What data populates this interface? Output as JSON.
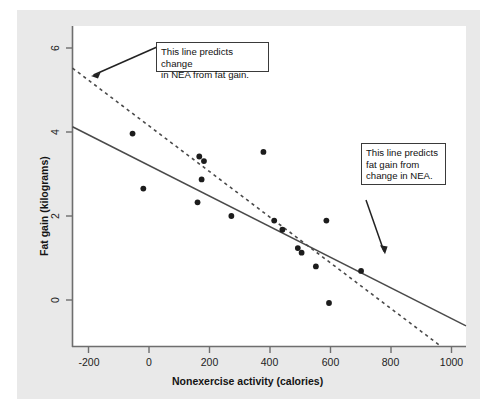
{
  "figure": {
    "background_color": "#e9e9e9",
    "plot_background_color": "#ffffff",
    "axis_color": "#6e6e6e",
    "point_color": "#1c1c1c",
    "line_color": "#4a4a4a"
  },
  "chart_data": {
    "type": "scatter",
    "title": "",
    "xlabel": "Nonexercise activity (calories)",
    "ylabel": "Fat gain (kilograms)",
    "xlim": [
      -300,
      1050
    ],
    "ylim": [
      -0.45,
      6.55
    ],
    "xticks": [
      -200,
      0,
      200,
      400,
      600,
      800,
      1000
    ],
    "xtick_labels": [
      "-200",
      "0",
      "200",
      "400",
      "600",
      "800",
      "1000"
    ],
    "yticks": [
      0,
      2,
      4,
      6
    ],
    "ytick_labels": [
      "0",
      "2",
      "4",
      "6"
    ],
    "grid": false,
    "legend": "none",
    "points": [
      {
        "x": -94,
        "y": 4.2
      },
      {
        "x": -57,
        "y": 3.0
      },
      {
        "x": 135,
        "y": 3.7
      },
      {
        "x": 143,
        "y": 3.2
      },
      {
        "x": 151,
        "y": 3.6
      },
      {
        "x": 129,
        "y": 2.7
      },
      {
        "x": 245,
        "y": 2.4
      },
      {
        "x": 355,
        "y": 3.8
      },
      {
        "x": 420,
        "y": 2.1
      },
      {
        "x": 392,
        "y": 2.3
      },
      {
        "x": 473,
        "y": 1.7
      },
      {
        "x": 486,
        "y": 1.6
      },
      {
        "x": 535,
        "y": 1.3
      },
      {
        "x": 571,
        "y": 2.3
      },
      {
        "x": 580,
        "y": 0.5
      },
      {
        "x": 690,
        "y": 1.2
      }
    ],
    "lines": [
      {
        "name": "fat-gain-from-nea",
        "style": "solid",
        "description": "This line predicts fat gain from change in NEA.",
        "x1": -300,
        "y1": 4.35,
        "x2": 1050,
        "y2": 0.0
      },
      {
        "name": "nea-from-fat-gain",
        "style": "dashed",
        "description": "This line predicts change in NEA from fat gain.",
        "x1": -300,
        "y1": 5.63,
        "x2": 965,
        "y2": -0.45
      }
    ],
    "annotations": [
      {
        "id": "callout-left",
        "line1": "This line predicts change",
        "line2": "in NEA from fat gain.",
        "points_to": {
          "x": -195,
          "y": 5.05
        }
      },
      {
        "id": "callout-right",
        "line1": "This line predicts",
        "line2": "fat gain from",
        "line3": "change in NEA.",
        "points_to": {
          "x": 760,
          "y": 1.03
        }
      }
    ]
  }
}
